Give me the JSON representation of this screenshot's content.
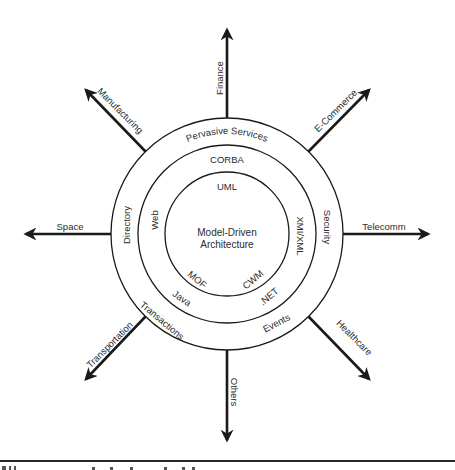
{
  "diagram": {
    "center": {
      "line1": "Model-Driven",
      "line2": "Architecture"
    },
    "inner_ring": {
      "top": "UML",
      "right": "XMI/XML",
      "bottom_right": "CWM",
      "bottom_left": "MOF"
    },
    "middle_ring": {
      "top": "CORBA",
      "left": "Web",
      "bottom_left": "Java",
      "bottom_right": ".NET"
    },
    "outer_ring": {
      "top": "Pervasive Services",
      "left": "Directory",
      "right": "Security",
      "bottom_left": "Transactions",
      "bottom_right": "Events"
    },
    "spokes": {
      "top": "Finance",
      "top_right": "E-Commerce",
      "right": "Telecomm",
      "bottom_right": "Healthcare",
      "bottom": "Others",
      "bottom_left": "Transportation",
      "left": "Space",
      "top_left": "Manufacturing"
    },
    "colors": {
      "stroke": "#1a1a1a",
      "text": "#2b2b2b",
      "background": "#ffffff"
    }
  }
}
